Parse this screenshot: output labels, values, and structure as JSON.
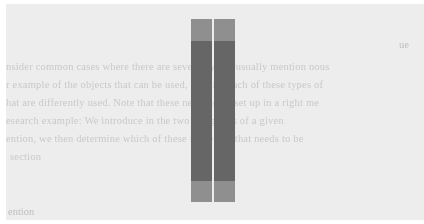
{
  "document": {
    "heading_fragment_top": "ue",
    "lines": [
      "nsider common cases where there are several types, usually mention nous",
      "r example of the objects that can be used, identify each of these types of",
      "hat are differently used. Note that these needs to be set up in a right me",
      "esearch example: We introduce in the two categories of a given",
      "ention, we then determine which of these is the one that needs to be",
      "section"
    ],
    "heading_fragment_bottom": "ention"
  },
  "overlay_bars": {
    "light_color": "#8f8f8f",
    "dark_color": "#666666",
    "bars": [
      {
        "name": "left-bar"
      },
      {
        "name": "right-bar"
      }
    ]
  }
}
